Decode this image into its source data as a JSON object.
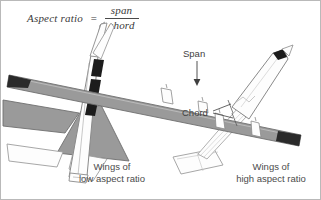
{
  "figure": {
    "background_color": "#ffffff",
    "border_color": "#b9b9b9"
  },
  "formula": {
    "lhs": "Aspect ratio",
    "equals": "=",
    "numerator": "span",
    "denominator": "chord"
  },
  "callouts": {
    "span": "Span",
    "chord": "Chord"
  },
  "captions": {
    "low": {
      "line1": "Wings of",
      "line2": "low aspect ratio"
    },
    "high": {
      "line1": "Wings of",
      "line2": "high aspect ratio"
    }
  },
  "colors": {
    "wing_fill": "#9a9a9a",
    "wing_fill_light": "#b5b5b5",
    "body_fill": "#fdfdfd",
    "outline": "#6f6f6f",
    "outline_light": "#9d9d9d",
    "dark": "#1c1c1c",
    "text": "#4b4b4b"
  },
  "aircraft": [
    {
      "name": "low-aspect-ratio-jet",
      "description": "Delta-wing fighter jet viewed from above, oriented diagonally nose up-right",
      "wing_type": "delta / low aspect ratio"
    },
    {
      "name": "high-aspect-ratio-turboprop",
      "description": "Four-engine turboprop airliner viewed from above, long straight wings oriented diagonally",
      "wing_type": "straight / high aspect ratio",
      "engine_count": 4
    }
  ]
}
